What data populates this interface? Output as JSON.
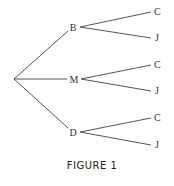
{
  "diagram": {
    "type": "tree",
    "caption": "FIGURE 1",
    "root": {
      "x": 14,
      "y": 79
    },
    "nodes": [
      {
        "label": "B",
        "x": 73,
        "y": 27,
        "children": [
          {
            "label": "C",
            "x": 157,
            "y": 12
          },
          {
            "label": "J",
            "x": 157,
            "y": 38
          }
        ]
      },
      {
        "label": "M",
        "x": 73,
        "y": 79,
        "children": [
          {
            "label": "C",
            "x": 157,
            "y": 65
          },
          {
            "label": "J",
            "x": 157,
            "y": 91
          }
        ]
      },
      {
        "label": "D",
        "x": 73,
        "y": 132,
        "children": [
          {
            "label": "C",
            "x": 157,
            "y": 118
          },
          {
            "label": "J",
            "x": 157,
            "y": 145
          }
        ]
      }
    ]
  }
}
